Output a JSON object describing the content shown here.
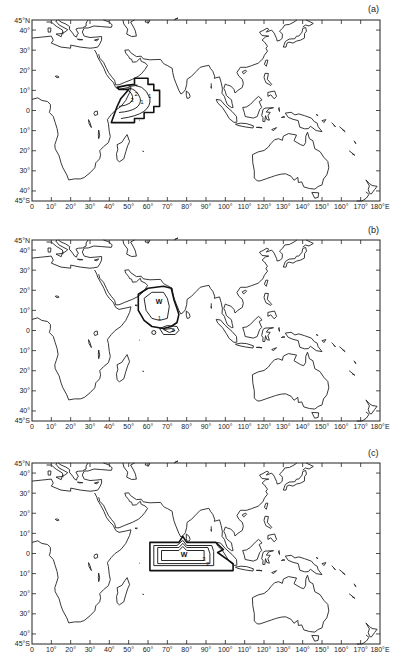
{
  "figure": {
    "panels": [
      {
        "id": "a",
        "label": "(a)",
        "anomaly_marker": "",
        "contour_labels": [
          "2",
          "1",
          "1",
          "2"
        ]
      },
      {
        "id": "b",
        "label": "(b)",
        "anomaly_marker": "W",
        "contour_labels": [
          "1",
          "2"
        ]
      },
      {
        "id": "c",
        "label": "(c)",
        "anomaly_marker": "W",
        "contour_labels": [
          "3",
          "2"
        ]
      }
    ],
    "axes": {
      "lat_ticks": [
        "45°N",
        "40°",
        "30°",
        "20°",
        "10°",
        "0",
        "10°",
        "20°",
        "30°",
        "40°",
        "45°S"
      ],
      "lon_ticks": [
        "0",
        "10°",
        "20°",
        "30°",
        "40°",
        "50°",
        "60°",
        "70°",
        "80°",
        "90°",
        "100°",
        "110°",
        "120°",
        "130°",
        "140°",
        "150°",
        "160°",
        "170°",
        "180°E"
      ]
    },
    "colors": {
      "line": "#222222",
      "background": "#ffffff"
    }
  }
}
